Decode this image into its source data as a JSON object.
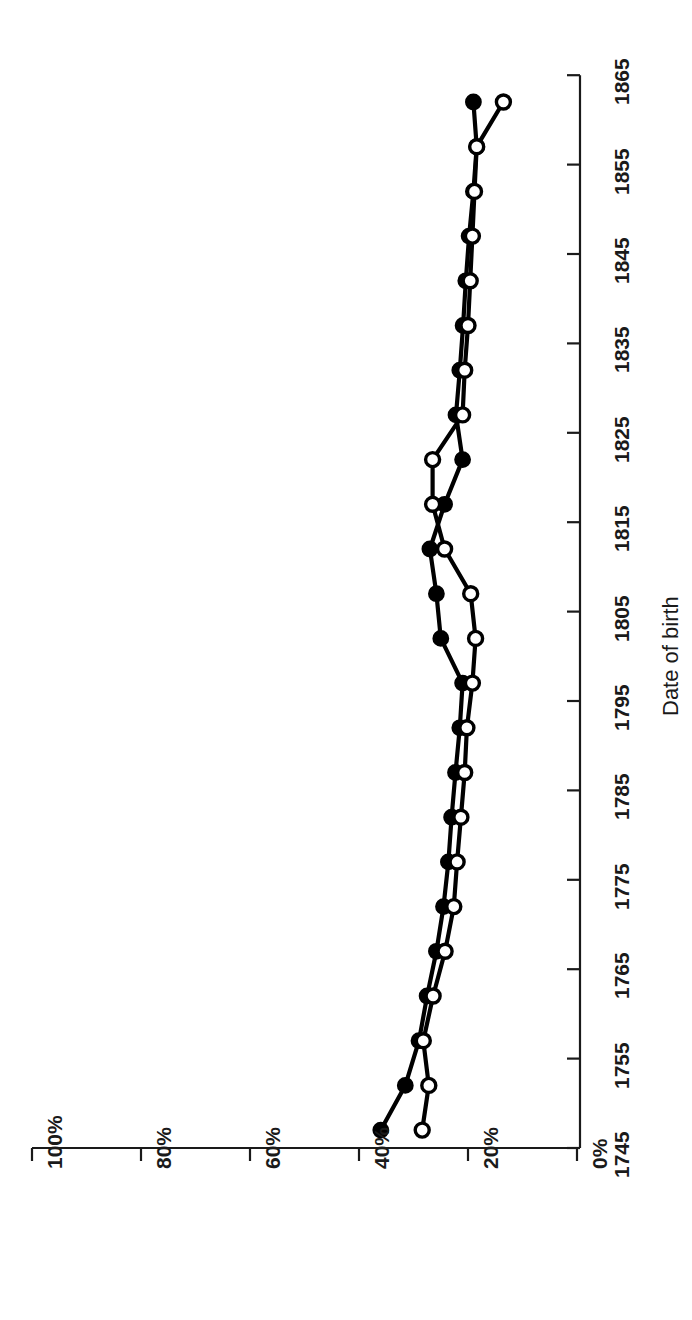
{
  "chart_data": {
    "type": "line",
    "title": "",
    "subtitle": "",
    "orientation": "rotated-90-ccw",
    "xlabel": "Date of birth",
    "ylabel": "",
    "xlim": [
      1745,
      1865
    ],
    "ylim": [
      0,
      100
    ],
    "grid": false,
    "legend": "none",
    "x_tick_labels": [
      "1745",
      "1755",
      "1765",
      "1775",
      "1785",
      "1795",
      "1805",
      "1815",
      "1825",
      "1835",
      "1845",
      "1855",
      "1865"
    ],
    "y_tick_labels": [
      "0%",
      "20%",
      "40%",
      "60%",
      "80%",
      "100%"
    ],
    "x_ticks": [
      1745,
      1755,
      1765,
      1775,
      1785,
      1795,
      1805,
      1815,
      1825,
      1835,
      1845,
      1855,
      1865
    ],
    "y_ticks": [
      0,
      20,
      40,
      60,
      80,
      100
    ],
    "x": [
      1747,
      1752,
      1757,
      1762,
      1767,
      1772,
      1777,
      1782,
      1787,
      1792,
      1797,
      1802,
      1807,
      1812,
      1817,
      1822,
      1827,
      1832,
      1837,
      1842,
      1847,
      1852,
      1857,
      1862
    ],
    "series": [
      {
        "name": "filled-series",
        "marker": "filled-circle",
        "color": "#000000",
        "values": [
          36.0,
          31.5,
          29.0,
          27.5,
          25.8,
          24.5,
          23.6,
          23.0,
          22.3,
          21.5,
          21.0,
          25.0,
          25.8,
          27.0,
          24.3,
          21.0,
          22.2,
          21.5,
          20.9,
          20.4,
          19.8,
          19.0,
          18.4,
          19.0
        ]
      },
      {
        "name": "open-series",
        "marker": "open-circle",
        "color": "#000000",
        "values": [
          28.4,
          27.2,
          28.2,
          26.4,
          24.2,
          22.6,
          22.0,
          21.3,
          20.6,
          20.2,
          19.2,
          18.6,
          19.5,
          24.3,
          26.5,
          26.5,
          21.0,
          20.6,
          20.0,
          19.6,
          19.2,
          18.8,
          18.4,
          13.5
        ]
      }
    ]
  },
  "axis": {
    "value_axis_name": "percentage-axis",
    "category_axis_name": "year-axis"
  }
}
